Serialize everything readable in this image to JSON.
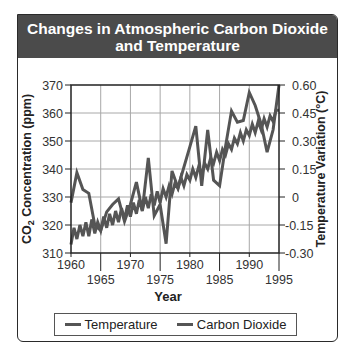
{
  "chart_data": {
    "type": "line",
    "title": "Changes in Atmospheric Carbon Dioxide and Temperature",
    "title_lines": [
      "Changes in Atmospheric Carbon Dioxide",
      "and Temperature"
    ],
    "xlabel": "Year",
    "ylabel_left": "CO2 Concentration (ppm)",
    "ylabel_right": "Temperature Variation (°C)",
    "xlim": [
      1960,
      1995
    ],
    "ylim_left": [
      310,
      370
    ],
    "ylim_right": [
      -0.3,
      0.6
    ],
    "x_ticks_upper": [
      "1960",
      "1970",
      "1980",
      "1990"
    ],
    "x_ticks_lower": [
      "1965",
      "1975",
      "1985",
      "1995"
    ],
    "y_ticks_left": [
      "370",
      "360",
      "350",
      "340",
      "330",
      "320",
      "310"
    ],
    "y_ticks_right": [
      "0.60",
      "0.45",
      "0.30",
      "0.15",
      "0",
      "-0.15",
      "-0.30"
    ],
    "grid": true,
    "legend_position": "bottom",
    "series": [
      {
        "name": "Temperature",
        "axis": "right",
        "color": "#555555",
        "x": [
          1960,
          1961,
          1962,
          1963,
          1964,
          1965,
          1966,
          1967,
          1968,
          1969,
          1970,
          1971,
          1972,
          1973,
          1974,
          1975,
          1976,
          1977,
          1978,
          1979,
          1980,
          1981,
          1982,
          1983,
          1984,
          1985,
          1986,
          1987,
          1988,
          1989,
          1990,
          1991,
          1992,
          1993,
          1994,
          1995
        ],
        "values": [
          -0.03,
          0.13,
          0.04,
          0.02,
          -0.15,
          -0.18,
          -0.08,
          -0.04,
          -0.01,
          -0.13,
          -0.04,
          0.08,
          -0.07,
          0.21,
          -0.1,
          -0.04,
          -0.25,
          0.14,
          0.05,
          0.16,
          0.27,
          0.38,
          0.06,
          0.36,
          0.09,
          0.06,
          0.27,
          0.46,
          0.4,
          0.41,
          0.56,
          0.49,
          0.39,
          0.24,
          0.36,
          0.6
        ]
      },
      {
        "name": "Carbon Dioxide",
        "axis": "left",
        "color": "#555555",
        "x": [
          1960,
          1960.5,
          1961,
          1961.5,
          1962,
          1962.5,
          1963,
          1963.5,
          1964,
          1964.5,
          1965,
          1965.5,
          1966,
          1966.5,
          1967,
          1967.5,
          1968,
          1968.5,
          1969,
          1969.5,
          1970,
          1970.5,
          1971,
          1971.5,
          1972,
          1972.5,
          1973,
          1973.5,
          1974,
          1974.5,
          1975,
          1975.5,
          1976,
          1976.5,
          1977,
          1977.5,
          1978,
          1978.5,
          1979,
          1979.5,
          1980,
          1980.5,
          1981,
          1981.5,
          1982,
          1982.5,
          1983,
          1983.5,
          1984,
          1984.5,
          1985,
          1985.5,
          1986,
          1986.5,
          1987,
          1987.5,
          1988,
          1988.5,
          1989,
          1989.5,
          1990,
          1990.5,
          1991,
          1991.5,
          1992,
          1992.5,
          1993,
          1993.5,
          1994,
          1994.5,
          1995
        ],
        "values": [
          313,
          319,
          315,
          320,
          316,
          321,
          316,
          322,
          317,
          321,
          318,
          323,
          319,
          324,
          320,
          325,
          321,
          326,
          322,
          327,
          323,
          328,
          324,
          329,
          325,
          330,
          326,
          331,
          327,
          332,
          328,
          333,
          330,
          334,
          331,
          335,
          333,
          337,
          334,
          338,
          336,
          340,
          337,
          341,
          338,
          342,
          340,
          344,
          342,
          346,
          343,
          347,
          345,
          349,
          347,
          351,
          349,
          353,
          350,
          354,
          352,
          356,
          353,
          357,
          354,
          358,
          355,
          359,
          357,
          361,
          361
        ]
      }
    ]
  },
  "legend": {
    "items": [
      "Temperature",
      "Carbon Dioxide"
    ]
  }
}
